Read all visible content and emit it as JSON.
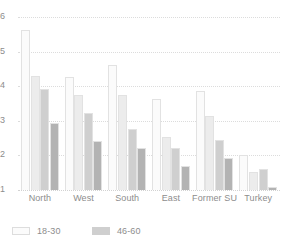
{
  "chart_data": {
    "type": "bar",
    "title": "",
    "subtitle": "",
    "xlabel": "",
    "ylabel": "",
    "categories": [
      "North",
      "West",
      "South",
      "East",
      "Former SU",
      "Turkey"
    ],
    "series": [
      {
        "name": "18-30",
        "color": "#fbfbfb",
        "values": [
          5.62,
          4.28,
          4.62,
          3.62,
          3.85,
          2.0
        ]
      },
      {
        "name": "31-45",
        "color": "#ececec",
        "values": [
          4.3,
          3.75,
          3.75,
          2.53,
          3.15,
          1.52
        ]
      },
      {
        "name": "46-60",
        "color": "#cfcfcf",
        "values": [
          3.92,
          3.22,
          2.75,
          2.22,
          2.45,
          1.6
        ]
      },
      {
        "name": "61+",
        "color": "#b3b3b3",
        "values": [
          2.93,
          2.42,
          2.22,
          1.7,
          1.93,
          1.1
        ]
      }
    ],
    "ylim": [
      1,
      6
    ],
    "yticks": [
      1,
      2,
      3,
      4,
      5,
      6
    ],
    "ytick_labels": [
      "1",
      "2",
      "3",
      "4",
      "5",
      "6"
    ],
    "grid": true,
    "grid_axis": "y",
    "legend_position": "bottom-left",
    "legend_entries": [
      {
        "label": "18-30",
        "color": "#fbfbfb",
        "border": "#dddddd"
      },
      {
        "label": "46-60",
        "color": "#cfcfcf",
        "border": "#cfcfcf"
      }
    ],
    "bar_edge_color": "#e2e2e2",
    "background": "#ffffff",
    "gridline_color": "#dcdcdc",
    "text_color": "#8d8d8d"
  }
}
